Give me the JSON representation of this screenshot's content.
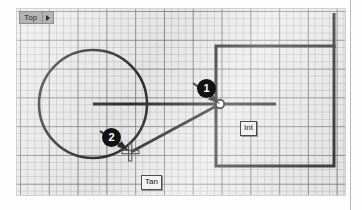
{
  "viewport": {
    "label": "Top",
    "label_caret_icon": "caret-right-icon",
    "background_color": "#e8e8e8",
    "grid": {
      "minor_spacing_px": 7,
      "major_spacing_px": 28,
      "minor_color": "#787878",
      "major_color": "#464646"
    }
  },
  "geometry": {
    "stroke_color": "#1a1a1a",
    "entities": [
      {
        "name": "circle",
        "type": "circle",
        "cx": 76,
        "cy": 95,
        "r": 54
      },
      {
        "name": "horizontal-line",
        "type": "line",
        "x1": 76,
        "y1": 95,
        "x2": 259,
        "y2": 95
      },
      {
        "name": "tangent-line",
        "type": "line",
        "x1": 113,
        "y1": 143,
        "x2": 203,
        "y2": 95
      },
      {
        "name": "rectangle",
        "type": "rect",
        "x": 199,
        "y": 37,
        "width": 118,
        "height": 120
      },
      {
        "name": "vertical-extension-line",
        "type": "line",
        "x1": 317,
        "y1": 5,
        "x2": 317,
        "y2": 37
      }
    ]
  },
  "snaps": [
    {
      "name": "intersection-snap",
      "label": "Int",
      "marker_icon": "intersection-node-icon",
      "x": 203,
      "y": 95
    },
    {
      "name": "tangent-snap",
      "label": "Tan",
      "marker_icon": "tangent-marker-icon",
      "x": 113,
      "y": 143
    }
  ],
  "callouts": [
    {
      "name": "callout-1",
      "number": "1",
      "points_to": "intersection-snap"
    },
    {
      "name": "callout-2",
      "number": "2",
      "points_to": "tangent-snap"
    }
  ]
}
